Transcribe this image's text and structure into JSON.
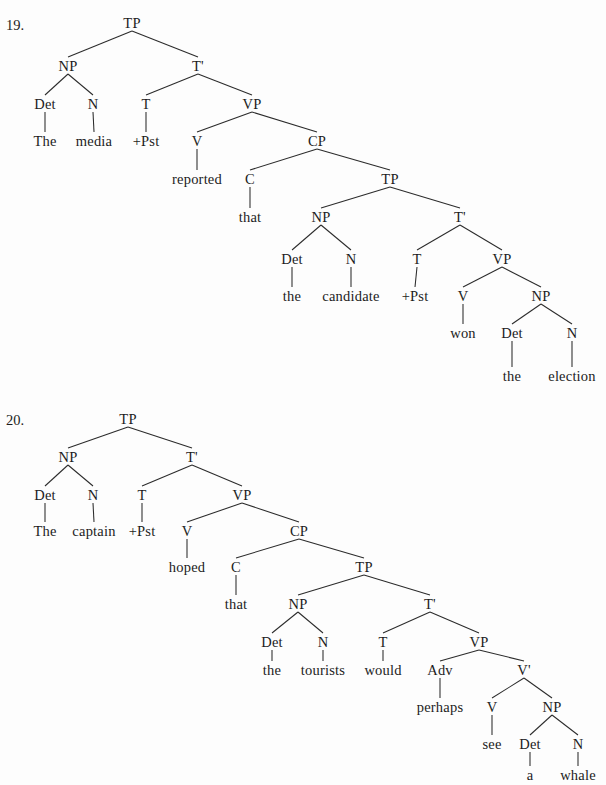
{
  "page": {
    "background": "#fdfdfd",
    "ink": "#1c1c1c",
    "width": 606,
    "height": 785
  },
  "exercises": [
    {
      "number": "19.",
      "number_pos": {
        "x": 6,
        "y": 18
      },
      "sentence": "The media +Pst reported that the candidate +Pst won the election",
      "nodes": [
        {
          "id": "n19_TP",
          "label": "TP",
          "x": 132,
          "y": 23,
          "kind": "category"
        },
        {
          "id": "n19_NP",
          "label": "NP",
          "x": 68,
          "y": 66,
          "kind": "category"
        },
        {
          "id": "n19_Tbar",
          "label": "T'",
          "x": 198,
          "y": 66,
          "kind": "category"
        },
        {
          "id": "n19_Det",
          "label": "Det",
          "x": 45,
          "y": 104,
          "kind": "category"
        },
        {
          "id": "n19_N",
          "label": "N",
          "x": 93,
          "y": 104,
          "kind": "category"
        },
        {
          "id": "n19_T",
          "label": "T",
          "x": 146,
          "y": 104,
          "kind": "category"
        },
        {
          "id": "n19_VP",
          "label": "VP",
          "x": 252,
          "y": 104,
          "kind": "category"
        },
        {
          "id": "n19_The",
          "label": "The",
          "x": 45,
          "y": 141,
          "kind": "word"
        },
        {
          "id": "n19_media",
          "label": "media",
          "x": 94,
          "y": 141,
          "kind": "word"
        },
        {
          "id": "n19_Pst1",
          "label": "+Pst",
          "x": 146,
          "y": 141,
          "kind": "word"
        },
        {
          "id": "n19_V",
          "label": "V",
          "x": 197,
          "y": 141,
          "kind": "category"
        },
        {
          "id": "n19_CP",
          "label": "CP",
          "x": 317,
          "y": 141,
          "kind": "category"
        },
        {
          "id": "n19_reported",
          "label": "reported",
          "x": 197,
          "y": 179,
          "kind": "word"
        },
        {
          "id": "n19_C",
          "label": "C",
          "x": 250,
          "y": 179,
          "kind": "category"
        },
        {
          "id": "n19_TP2",
          "label": "TP",
          "x": 390,
          "y": 179,
          "kind": "category"
        },
        {
          "id": "n19_that",
          "label": "that",
          "x": 250,
          "y": 217,
          "kind": "word"
        },
        {
          "id": "n19_NP2",
          "label": "NP",
          "x": 321,
          "y": 217,
          "kind": "category"
        },
        {
          "id": "n19_Tbar2",
          "label": "T'",
          "x": 460,
          "y": 217,
          "kind": "category"
        },
        {
          "id": "n19_Det2",
          "label": "Det",
          "x": 292,
          "y": 259,
          "kind": "category"
        },
        {
          "id": "n19_N2",
          "label": "N",
          "x": 351,
          "y": 259,
          "kind": "category"
        },
        {
          "id": "n19_T2",
          "label": "T",
          "x": 417,
          "y": 259,
          "kind": "category"
        },
        {
          "id": "n19_VP2",
          "label": "VP",
          "x": 502,
          "y": 259,
          "kind": "category"
        },
        {
          "id": "n19_the2",
          "label": "the",
          "x": 292,
          "y": 296,
          "kind": "word"
        },
        {
          "id": "n19_candidate",
          "label": "candidate",
          "x": 351,
          "y": 296,
          "kind": "word"
        },
        {
          "id": "n19_Pst2",
          "label": "+Pst",
          "x": 415,
          "y": 296,
          "kind": "word"
        },
        {
          "id": "n19_V2",
          "label": "V",
          "x": 463,
          "y": 296,
          "kind": "category"
        },
        {
          "id": "n19_NP3",
          "label": "NP",
          "x": 541,
          "y": 296,
          "kind": "category"
        },
        {
          "id": "n19_won",
          "label": "won",
          "x": 463,
          "y": 333,
          "kind": "word"
        },
        {
          "id": "n19_Det3",
          "label": "Det",
          "x": 512,
          "y": 333,
          "kind": "category"
        },
        {
          "id": "n19_N3",
          "label": "N",
          "x": 572,
          "y": 333,
          "kind": "category"
        },
        {
          "id": "n19_the3",
          "label": "the",
          "x": 512,
          "y": 376,
          "kind": "word"
        },
        {
          "id": "n19_election",
          "label": "election",
          "x": 572,
          "y": 376,
          "kind": "word"
        }
      ],
      "edges": [
        [
          "n19_TP",
          "n19_NP"
        ],
        [
          "n19_TP",
          "n19_Tbar"
        ],
        [
          "n19_NP",
          "n19_Det"
        ],
        [
          "n19_NP",
          "n19_N"
        ],
        [
          "n19_Tbar",
          "n19_T"
        ],
        [
          "n19_Tbar",
          "n19_VP"
        ],
        [
          "n19_Det",
          "n19_The"
        ],
        [
          "n19_N",
          "n19_media"
        ],
        [
          "n19_T",
          "n19_Pst1"
        ],
        [
          "n19_VP",
          "n19_V"
        ],
        [
          "n19_VP",
          "n19_CP"
        ],
        [
          "n19_V",
          "n19_reported"
        ],
        [
          "n19_CP",
          "n19_C"
        ],
        [
          "n19_CP",
          "n19_TP2"
        ],
        [
          "n19_C",
          "n19_that"
        ],
        [
          "n19_TP2",
          "n19_NP2"
        ],
        [
          "n19_TP2",
          "n19_Tbar2"
        ],
        [
          "n19_NP2",
          "n19_Det2"
        ],
        [
          "n19_NP2",
          "n19_N2"
        ],
        [
          "n19_Tbar2",
          "n19_T2"
        ],
        [
          "n19_Tbar2",
          "n19_VP2"
        ],
        [
          "n19_Det2",
          "n19_the2"
        ],
        [
          "n19_N2",
          "n19_candidate"
        ],
        [
          "n19_T2",
          "n19_Pst2"
        ],
        [
          "n19_VP2",
          "n19_V2"
        ],
        [
          "n19_VP2",
          "n19_NP3"
        ],
        [
          "n19_V2",
          "n19_won"
        ],
        [
          "n19_NP3",
          "n19_Det3"
        ],
        [
          "n19_NP3",
          "n19_N3"
        ],
        [
          "n19_Det3",
          "n19_the3"
        ],
        [
          "n19_N3",
          "n19_election"
        ]
      ]
    },
    {
      "number": "20.",
      "number_pos": {
        "x": 6,
        "y": 413
      },
      "sentence": "The captain +Pst hoped that the tourists would perhaps see a whale",
      "nodes": [
        {
          "id": "n20_TP",
          "label": "TP",
          "x": 128,
          "y": 419,
          "kind": "category"
        },
        {
          "id": "n20_NP",
          "label": "NP",
          "x": 68,
          "y": 457,
          "kind": "category"
        },
        {
          "id": "n20_Tbar",
          "label": "T'",
          "x": 192,
          "y": 457,
          "kind": "category"
        },
        {
          "id": "n20_Det",
          "label": "Det",
          "x": 45,
          "y": 495,
          "kind": "category"
        },
        {
          "id": "n20_N",
          "label": "N",
          "x": 93,
          "y": 495,
          "kind": "category"
        },
        {
          "id": "n20_T",
          "label": "T",
          "x": 142,
          "y": 495,
          "kind": "category"
        },
        {
          "id": "n20_VP",
          "label": "VP",
          "x": 242,
          "y": 495,
          "kind": "category"
        },
        {
          "id": "n20_The",
          "label": "The",
          "x": 45,
          "y": 531,
          "kind": "word"
        },
        {
          "id": "n20_captain",
          "label": "captain",
          "x": 94,
          "y": 531,
          "kind": "word"
        },
        {
          "id": "n20_Pst",
          "label": "+Pst",
          "x": 142,
          "y": 531,
          "kind": "word"
        },
        {
          "id": "n20_V",
          "label": "V",
          "x": 187,
          "y": 531,
          "kind": "category"
        },
        {
          "id": "n20_CP",
          "label": "CP",
          "x": 299,
          "y": 531,
          "kind": "category"
        },
        {
          "id": "n20_hoped",
          "label": "hoped",
          "x": 187,
          "y": 567,
          "kind": "word"
        },
        {
          "id": "n20_C",
          "label": "C",
          "x": 236,
          "y": 567,
          "kind": "category"
        },
        {
          "id": "n20_TP2",
          "label": "TP",
          "x": 364,
          "y": 567,
          "kind": "category"
        },
        {
          "id": "n20_that",
          "label": "that",
          "x": 236,
          "y": 604,
          "kind": "word"
        },
        {
          "id": "n20_NP2",
          "label": "NP",
          "x": 298,
          "y": 604,
          "kind": "category"
        },
        {
          "id": "n20_Tbar2",
          "label": "T'",
          "x": 430,
          "y": 604,
          "kind": "category"
        },
        {
          "id": "n20_Det2",
          "label": "Det",
          "x": 272,
          "y": 642,
          "kind": "category"
        },
        {
          "id": "n20_N2",
          "label": "N",
          "x": 323,
          "y": 642,
          "kind": "category"
        },
        {
          "id": "n20_T2",
          "label": "T",
          "x": 383,
          "y": 642,
          "kind": "category"
        },
        {
          "id": "n20_VP2",
          "label": "VP",
          "x": 479,
          "y": 642,
          "kind": "category"
        },
        {
          "id": "n20_the2",
          "label": "the",
          "x": 272,
          "y": 670,
          "kind": "word"
        },
        {
          "id": "n20_tourists",
          "label": "tourists",
          "x": 323,
          "y": 670,
          "kind": "word"
        },
        {
          "id": "n20_would",
          "label": "would",
          "x": 383,
          "y": 670,
          "kind": "word"
        },
        {
          "id": "n20_Adv",
          "label": "Adv",
          "x": 440,
          "y": 670,
          "kind": "category"
        },
        {
          "id": "n20_Vbar",
          "label": "V'",
          "x": 524,
          "y": 670,
          "kind": "category"
        },
        {
          "id": "n20_perhaps",
          "label": "perhaps",
          "x": 440,
          "y": 707,
          "kind": "word"
        },
        {
          "id": "n20_V2",
          "label": "V",
          "x": 492,
          "y": 707,
          "kind": "category"
        },
        {
          "id": "n20_NP3",
          "label": "NP",
          "x": 552,
          "y": 707,
          "kind": "category"
        },
        {
          "id": "n20_see",
          "label": "see",
          "x": 492,
          "y": 744,
          "kind": "word"
        },
        {
          "id": "n20_Det3",
          "label": "Det",
          "x": 530,
          "y": 744,
          "kind": "category"
        },
        {
          "id": "n20_N3",
          "label": "N",
          "x": 578,
          "y": 744,
          "kind": "category"
        },
        {
          "id": "n20_a",
          "label": "a",
          "x": 530,
          "y": 775,
          "kind": "word"
        },
        {
          "id": "n20_whale",
          "label": "whale",
          "x": 578,
          "y": 775,
          "kind": "word"
        }
      ],
      "edges": [
        [
          "n20_TP",
          "n20_NP"
        ],
        [
          "n20_TP",
          "n20_Tbar"
        ],
        [
          "n20_NP",
          "n20_Det"
        ],
        [
          "n20_NP",
          "n20_N"
        ],
        [
          "n20_Tbar",
          "n20_T"
        ],
        [
          "n20_Tbar",
          "n20_VP"
        ],
        [
          "n20_Det",
          "n20_The"
        ],
        [
          "n20_N",
          "n20_captain"
        ],
        [
          "n20_T",
          "n20_Pst"
        ],
        [
          "n20_VP",
          "n20_V"
        ],
        [
          "n20_VP",
          "n20_CP"
        ],
        [
          "n20_V",
          "n20_hoped"
        ],
        [
          "n20_CP",
          "n20_C"
        ],
        [
          "n20_CP",
          "n20_TP2"
        ],
        [
          "n20_C",
          "n20_that"
        ],
        [
          "n20_TP2",
          "n20_NP2"
        ],
        [
          "n20_TP2",
          "n20_Tbar2"
        ],
        [
          "n20_NP2",
          "n20_Det2"
        ],
        [
          "n20_NP2",
          "n20_N2"
        ],
        [
          "n20_Tbar2",
          "n20_T2"
        ],
        [
          "n20_Tbar2",
          "n20_VP2"
        ],
        [
          "n20_Det2",
          "n20_the2"
        ],
        [
          "n20_N2",
          "n20_tourists"
        ],
        [
          "n20_T2",
          "n20_would"
        ],
        [
          "n20_VP2",
          "n20_Adv"
        ],
        [
          "n20_VP2",
          "n20_Vbar"
        ],
        [
          "n20_Adv",
          "n20_perhaps"
        ],
        [
          "n20_Vbar",
          "n20_V2"
        ],
        [
          "n20_Vbar",
          "n20_NP3"
        ],
        [
          "n20_V2",
          "n20_see"
        ],
        [
          "n20_NP3",
          "n20_Det3"
        ],
        [
          "n20_NP3",
          "n20_N3"
        ],
        [
          "n20_Det3",
          "n20_a"
        ],
        [
          "n20_N3",
          "n20_whale"
        ]
      ]
    }
  ]
}
